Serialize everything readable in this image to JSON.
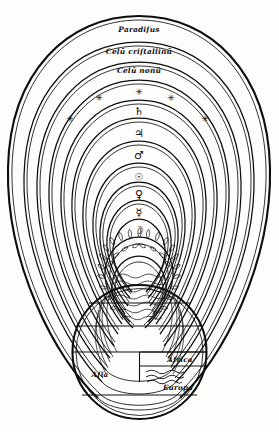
{
  "figure": {
    "medium": "woodcut engraving",
    "ink_color": "#0d0d0d",
    "paper_color": "#fdfdfc"
  },
  "spheres": [
    {
      "index": 1,
      "name": "paradise",
      "label": "Paradiſus",
      "kind": "named-heaven"
    },
    {
      "index": 2,
      "name": "crystalline-heaven",
      "label": "Celū criſtallinū",
      "kind": "named-heaven"
    },
    {
      "index": 3,
      "name": "ninth-heaven",
      "label": "Celū nonū",
      "kind": "named-heaven"
    },
    {
      "index": 4,
      "name": "firmament-of-stars",
      "label": "",
      "kind": "star-sphere",
      "glyph": "✳"
    },
    {
      "index": 5,
      "name": "saturn",
      "label": "",
      "kind": "planet",
      "glyph": "♄"
    },
    {
      "index": 6,
      "name": "jupiter",
      "label": "",
      "kind": "planet",
      "glyph": "♃"
    },
    {
      "index": 7,
      "name": "mars",
      "label": "",
      "kind": "planet",
      "glyph": "♂"
    },
    {
      "index": 8,
      "name": "sun",
      "label": "",
      "kind": "planet",
      "glyph": "☉"
    },
    {
      "index": 9,
      "name": "venus",
      "label": "",
      "kind": "planet",
      "glyph": "♀"
    },
    {
      "index": 10,
      "name": "mercury",
      "label": "",
      "kind": "planet",
      "glyph": "☿"
    },
    {
      "index": 11,
      "name": "moon",
      "label": "",
      "kind": "planet",
      "glyph": "☽"
    },
    {
      "index": 12,
      "name": "sphere-of-fire",
      "label": "",
      "kind": "element-fire"
    },
    {
      "index": 13,
      "name": "sphere-of-air",
      "label": "",
      "kind": "element-air"
    }
  ],
  "star_ring": {
    "name": "fixed-stars",
    "glyph": "✳",
    "count": 5
  },
  "earth": {
    "name": "terrestrial-globe",
    "map_type": "T-O map",
    "regions": [
      {
        "name": "asia",
        "label": "Aſia"
      },
      {
        "name": "africa",
        "label": "Africa"
      },
      {
        "name": "europa",
        "label": "Europa"
      }
    ]
  }
}
